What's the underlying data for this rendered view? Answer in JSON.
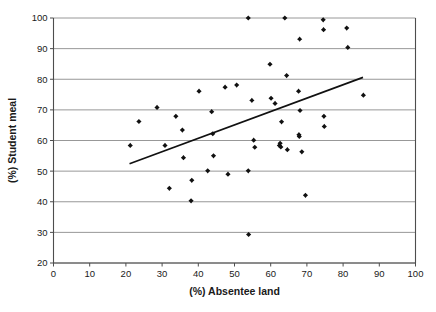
{
  "chart_data": {
    "type": "scatter",
    "title": "",
    "xlabel": "(%) Absentee land",
    "ylabel": "(%) Student meal",
    "xlim": [
      0,
      100
    ],
    "ylim": [
      20,
      100
    ],
    "xticks": [
      0,
      10,
      20,
      30,
      40,
      50,
      60,
      70,
      80,
      90,
      100
    ],
    "yticks": [
      20,
      30,
      40,
      50,
      60,
      70,
      80,
      90,
      100
    ],
    "grid": "horizontal",
    "legend": "none",
    "marker_color": "#111111",
    "gridline_color": "#8c8c8c",
    "trendline_color": "#111111",
    "points": [
      {
        "x": 21.2,
        "y": 58.4
      },
      {
        "x": 23.6,
        "y": 66.2
      },
      {
        "x": 28.6,
        "y": 70.8
      },
      {
        "x": 30.8,
        "y": 58.4
      },
      {
        "x": 32.0,
        "y": 44.4
      },
      {
        "x": 33.8,
        "y": 67.9
      },
      {
        "x": 35.6,
        "y": 63.4
      },
      {
        "x": 35.9,
        "y": 54.4
      },
      {
        "x": 38.0,
        "y": 40.3
      },
      {
        "x": 38.2,
        "y": 47.0
      },
      {
        "x": 40.2,
        "y": 76.1
      },
      {
        "x": 42.6,
        "y": 50.1
      },
      {
        "x": 43.7,
        "y": 69.4
      },
      {
        "x": 44.0,
        "y": 62.2
      },
      {
        "x": 44.2,
        "y": 55.0
      },
      {
        "x": 47.4,
        "y": 77.4
      },
      {
        "x": 48.2,
        "y": 49.0
      },
      {
        "x": 50.6,
        "y": 78.1
      },
      {
        "x": 53.8,
        "y": 100.0
      },
      {
        "x": 53.8,
        "y": 50.1
      },
      {
        "x": 53.9,
        "y": 29.3
      },
      {
        "x": 54.8,
        "y": 73.1
      },
      {
        "x": 55.3,
        "y": 60.1
      },
      {
        "x": 55.6,
        "y": 57.8
      },
      {
        "x": 59.8,
        "y": 84.9
      },
      {
        "x": 60.1,
        "y": 73.8
      },
      {
        "x": 61.2,
        "y": 72.1
      },
      {
        "x": 62.4,
        "y": 58.4
      },
      {
        "x": 62.6,
        "y": 59.1
      },
      {
        "x": 62.8,
        "y": 57.9
      },
      {
        "x": 63.0,
        "y": 66.1
      },
      {
        "x": 63.9,
        "y": 100.0
      },
      {
        "x": 64.4,
        "y": 81.2
      },
      {
        "x": 64.6,
        "y": 57.0
      },
      {
        "x": 67.7,
        "y": 76.1
      },
      {
        "x": 67.8,
        "y": 61.9
      },
      {
        "x": 67.9,
        "y": 61.3
      },
      {
        "x": 68.0,
        "y": 93.1
      },
      {
        "x": 68.1,
        "y": 69.8
      },
      {
        "x": 68.6,
        "y": 56.3
      },
      {
        "x": 69.6,
        "y": 42.1
      },
      {
        "x": 74.5,
        "y": 99.4
      },
      {
        "x": 74.6,
        "y": 96.2
      },
      {
        "x": 74.7,
        "y": 67.9
      },
      {
        "x": 74.8,
        "y": 64.6
      },
      {
        "x": 81.0,
        "y": 96.7
      },
      {
        "x": 81.3,
        "y": 90.4
      },
      {
        "x": 85.6,
        "y": 74.8
      }
    ],
    "trendline": {
      "x_start": 21.0,
      "y_start": 52.4,
      "x_end": 85.5,
      "y_end": 80.6
    }
  }
}
